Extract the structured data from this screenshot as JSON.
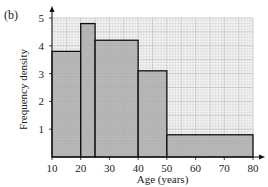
{
  "panel_label": "(b)",
  "chart_data": {
    "type": "bar",
    "subtype": "histogram",
    "title": "",
    "xlabel": "Age (years)",
    "ylabel": "Frequency density",
    "xlim": [
      10,
      80
    ],
    "ylim": [
      0,
      5
    ],
    "xticks": [
      10,
      20,
      30,
      40,
      50,
      60,
      70,
      80
    ],
    "yticks": [
      1,
      2,
      3,
      4,
      5
    ],
    "grid": true,
    "bins": [
      {
        "from": 10,
        "to": 20,
        "value": 3.8
      },
      {
        "from": 20,
        "to": 25,
        "value": 4.8
      },
      {
        "from": 25,
        "to": 40,
        "value": 4.2
      },
      {
        "from": 40,
        "to": 50,
        "value": 3.1
      },
      {
        "from": 50,
        "to": 80,
        "value": 0.8
      }
    ],
    "colors": {
      "bar_fill": "#a9a9a9",
      "grid_minor": "#c8c8c8",
      "grid_major": "#b0b0b0",
      "axis": "#111111"
    }
  }
}
